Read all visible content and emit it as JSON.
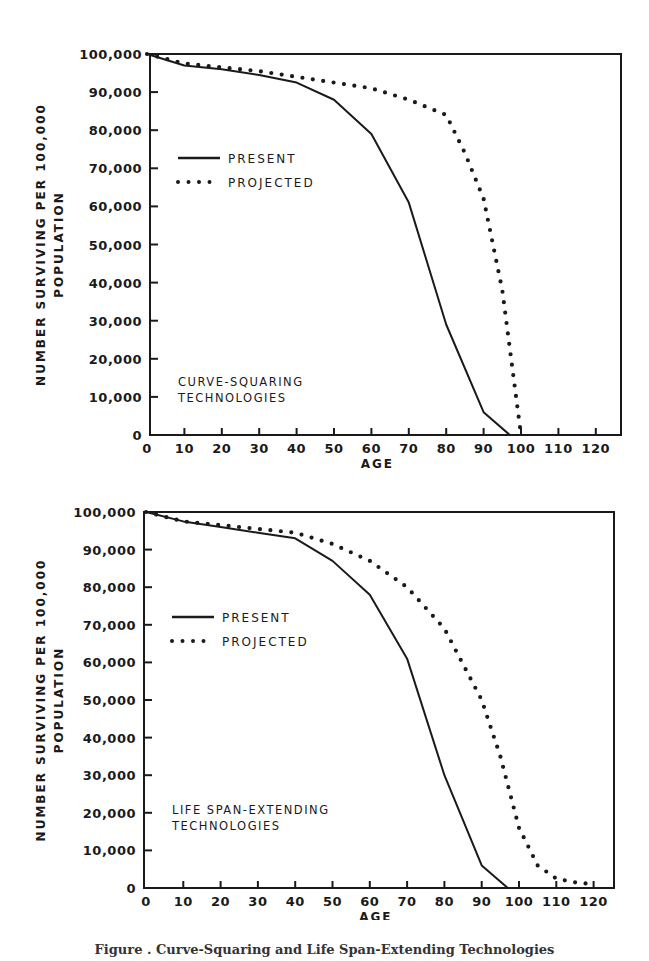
{
  "chart_data": [
    {
      "type": "line",
      "title": "",
      "annotation": [
        "CURVE-SQUARING",
        "TECHNOLOGIES"
      ],
      "xlabel": "AGE",
      "ylabel": [
        "NUMBER SURVIVING PER 100,000",
        "POPULATION"
      ],
      "xlim": [
        0,
        125
      ],
      "ylim": [
        0,
        100000
      ],
      "xticks": [
        0,
        10,
        20,
        30,
        40,
        50,
        60,
        70,
        80,
        90,
        100,
        110,
        120
      ],
      "yticks": [
        0,
        10000,
        20000,
        30000,
        40000,
        50000,
        60000,
        70000,
        80000,
        90000,
        100000
      ],
      "ytick_labels": [
        "0",
        "10,000",
        "20,000",
        "30,000",
        "40,000",
        "50,000",
        "60,000",
        "70,000",
        "80,000",
        "90,000",
        "100,000"
      ],
      "legend": {
        "position": "upper-left-inside",
        "entries": [
          "PRESENT",
          "PROJECTED"
        ]
      },
      "grid": false,
      "series": [
        {
          "name": "PRESENT",
          "style": "solid",
          "x": [
            0,
            10,
            20,
            30,
            40,
            50,
            60,
            70,
            80,
            90,
            97
          ],
          "y": [
            100000,
            97000,
            96000,
            94500,
            92500,
            88000,
            79000,
            61000,
            29000,
            6000,
            0
          ]
        },
        {
          "name": "PROJECTED",
          "style": "dotted",
          "x": [
            0,
            10,
            20,
            30,
            40,
            50,
            60,
            70,
            80,
            85,
            90,
            95,
            100
          ],
          "y": [
            100000,
            97500,
            96500,
            95500,
            94000,
            92500,
            91000,
            88000,
            84000,
            74000,
            62000,
            38000,
            0
          ]
        }
      ]
    },
    {
      "type": "line",
      "title": "",
      "annotation": [
        "LIFE SPAN-EXTENDING",
        "TECHNOLOGIES"
      ],
      "xlabel": "AGE",
      "ylabel": [
        "NUMBER SURVIVING PER 100,000",
        "POPULATION"
      ],
      "xlim": [
        0,
        125
      ],
      "ylim": [
        0,
        100000
      ],
      "xticks": [
        0,
        10,
        20,
        30,
        40,
        50,
        60,
        70,
        80,
        90,
        100,
        110,
        120
      ],
      "yticks": [
        0,
        10000,
        20000,
        30000,
        40000,
        50000,
        60000,
        70000,
        80000,
        90000,
        100000
      ],
      "ytick_labels": [
        "0",
        "10,000",
        "20,000",
        "30,000",
        "40,000",
        "50,000",
        "60,000",
        "70,000",
        "80,000",
        "90,000",
        "100,000"
      ],
      "legend": {
        "position": "upper-left-inside",
        "entries": [
          "PRESENT",
          "PROJECTED"
        ]
      },
      "grid": false,
      "series": [
        {
          "name": "PRESENT",
          "style": "solid",
          "x": [
            0,
            10,
            20,
            30,
            40,
            50,
            60,
            70,
            80,
            90,
            97
          ],
          "y": [
            100000,
            97500,
            96000,
            94500,
            93000,
            87000,
            78000,
            61000,
            30000,
            6000,
            0
          ]
        },
        {
          "name": "PROJECTED",
          "style": "dotted",
          "x": [
            0,
            10,
            20,
            30,
            40,
            50,
            60,
            70,
            80,
            90,
            95,
            100,
            105,
            110,
            115,
            120
          ],
          "y": [
            100000,
            97500,
            96500,
            95500,
            94500,
            91500,
            87000,
            80000,
            69000,
            50000,
            35000,
            16000,
            6000,
            2500,
            1500,
            1000
          ]
        }
      ]
    }
  ],
  "caption": "Figure . Curve-Squaring and Life Span-Extending Technologies"
}
